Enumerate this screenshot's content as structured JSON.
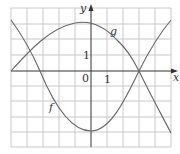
{
  "figure": {
    "axis_labels": {
      "x": "x",
      "y": "y"
    },
    "origin_label": "0",
    "tick_x_label": "1",
    "tick_y_label": "1",
    "curve_labels": {
      "f": "f",
      "g": "g"
    },
    "colors": {
      "grid": "#c8c8c8",
      "axis": "#333333",
      "curve": "#666666"
    }
  }
}
